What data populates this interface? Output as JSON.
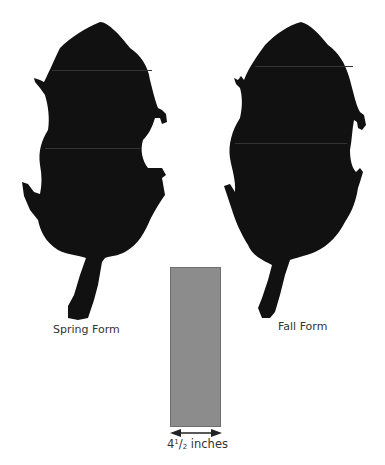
{
  "figure": {
    "specimens": [
      {
        "name": "spring-form",
        "label": "Spring Form",
        "color": "#111111"
      },
      {
        "name": "fall-form",
        "label": "Fall Form",
        "color": "#111111"
      }
    ],
    "scale_bar": {
      "width_whole": "4",
      "width_num": "1",
      "width_den": "2",
      "unit": "inches",
      "fill_color": "#8c8c8c"
    }
  }
}
